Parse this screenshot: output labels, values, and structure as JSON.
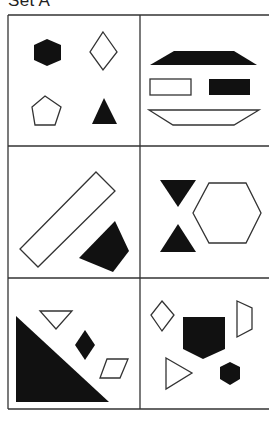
{
  "title": "Set A",
  "colors": {
    "line": "#333333",
    "fill": "#111111",
    "bg": "#ffffff"
  },
  "grid": {
    "rows": 3,
    "cols": 2
  },
  "cells": [
    {
      "row": 1,
      "col": 1,
      "shapes": [
        "filled hexagon",
        "outline diamond",
        "outline pentagon",
        "filled triangle"
      ]
    },
    {
      "row": 1,
      "col": 2,
      "shapes": [
        "filled trapezoid",
        "outline rectangle",
        "filled rectangle",
        "outline inverted trapezoid"
      ]
    },
    {
      "row": 2,
      "col": 1,
      "shapes": [
        "outline rotated rectangle",
        "filled quadrilateral"
      ]
    },
    {
      "row": 2,
      "col": 2,
      "shapes": [
        "filled down triangle",
        "filled up triangle",
        "outline hexagon"
      ]
    },
    {
      "row": 3,
      "col": 1,
      "shapes": [
        "filled right triangle",
        "outline down triangle",
        "filled diamond",
        "outline parallelogram"
      ]
    },
    {
      "row": 3,
      "col": 2,
      "shapes": [
        "outline diamond",
        "filled pentagon",
        "outline trapezoid",
        "outline right-pointing triangle",
        "filled hexagon"
      ]
    }
  ]
}
